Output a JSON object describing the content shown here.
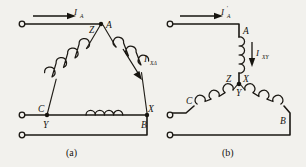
{
  "figure": {
    "kind": "electrical-schematic",
    "background_color": "#f2f1ed",
    "ink_color": "#16140f",
    "panels": [
      {
        "id": "a",
        "caption": "(a)",
        "connection": "delta",
        "current_labels": [
          {
            "id": "line-current",
            "symbol": "I",
            "subscript": "A",
            "prime": false
          },
          {
            "id": "winding-current",
            "symbol": "I",
            "subscript": "XΔ",
            "prime": false
          }
        ],
        "nodes": [
          {
            "id": "apex-a",
            "label": "A"
          },
          {
            "id": "apex-z",
            "label": "Z"
          },
          {
            "id": "left-c",
            "label": "C"
          },
          {
            "id": "left-y",
            "label": "Y"
          },
          {
            "id": "right-x",
            "label": "X"
          },
          {
            "id": "right-b",
            "label": "B"
          }
        ],
        "terminal_count": 3
      },
      {
        "id": "b",
        "caption": "(b)",
        "connection": "star",
        "current_labels": [
          {
            "id": "line-current",
            "symbol": "I",
            "subscript": "A",
            "prime": true
          },
          {
            "id": "winding-current",
            "symbol": "I",
            "subscript": "XY",
            "prime": false
          }
        ],
        "nodes": [
          {
            "id": "top-a",
            "label": "A"
          },
          {
            "id": "center-z",
            "label": "Z"
          },
          {
            "id": "center-x",
            "label": "X"
          },
          {
            "id": "center-y",
            "label": "Y"
          },
          {
            "id": "left-c",
            "label": "C"
          },
          {
            "id": "right-b",
            "label": "B"
          }
        ],
        "terminal_count": 3
      }
    ]
  }
}
